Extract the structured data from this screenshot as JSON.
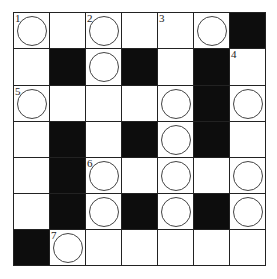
{
  "puzzle": {
    "rows": 7,
    "cols": 7,
    "cells": [
      [
        {
          "t": "w",
          "c": true,
          "n": "1"
        },
        {
          "t": "w"
        },
        {
          "t": "w",
          "c": true,
          "n": "2"
        },
        {
          "t": "w"
        },
        {
          "t": "w",
          "n": "3"
        },
        {
          "t": "w",
          "c": true
        },
        {
          "t": "b"
        }
      ],
      [
        {
          "t": "w"
        },
        {
          "t": "b"
        },
        {
          "t": "w",
          "c": true
        },
        {
          "t": "b"
        },
        {
          "t": "w"
        },
        {
          "t": "b"
        },
        {
          "t": "w",
          "n": "4"
        }
      ],
      [
        {
          "t": "w",
          "c": true,
          "n": "5"
        },
        {
          "t": "w"
        },
        {
          "t": "w"
        },
        {
          "t": "w"
        },
        {
          "t": "w",
          "c": true
        },
        {
          "t": "b"
        },
        {
          "t": "w",
          "c": true
        }
      ],
      [
        {
          "t": "w"
        },
        {
          "t": "b"
        },
        {
          "t": "w"
        },
        {
          "t": "b"
        },
        {
          "t": "w",
          "c": true
        },
        {
          "t": "b"
        },
        {
          "t": "w"
        }
      ],
      [
        {
          "t": "w"
        },
        {
          "t": "b"
        },
        {
          "t": "w",
          "c": true,
          "n": "6"
        },
        {
          "t": "w"
        },
        {
          "t": "w",
          "c": true
        },
        {
          "t": "w"
        },
        {
          "t": "w",
          "c": true
        }
      ],
      [
        {
          "t": "w"
        },
        {
          "t": "b"
        },
        {
          "t": "w",
          "c": true
        },
        {
          "t": "b"
        },
        {
          "t": "w",
          "c": true
        },
        {
          "t": "b"
        },
        {
          "t": "w",
          "c": true
        }
      ],
      [
        {
          "t": "b"
        },
        {
          "t": "w",
          "c": true,
          "n": "7"
        },
        {
          "t": "w"
        },
        {
          "t": "w"
        },
        {
          "t": "w"
        },
        {
          "t": "w"
        },
        {
          "t": "w"
        }
      ]
    ]
  },
  "colors": {
    "black_cell": "#0d0d0d",
    "grid_line": "#222222",
    "circle": "#444444"
  }
}
